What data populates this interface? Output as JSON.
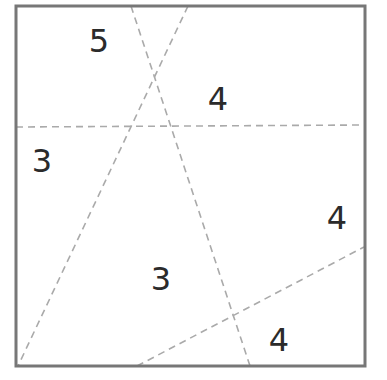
{
  "diagram": {
    "square": {
      "x1": 16,
      "y1": 6,
      "x2": 365,
      "y2": 366,
      "stroke": "#777777",
      "stroke_width": 3
    },
    "cut_lines": [
      {
        "x1": 131,
        "y1": 6,
        "x2": 250,
        "y2": 366
      },
      {
        "x1": 188,
        "y1": 6,
        "x2": 18,
        "y2": 366
      },
      {
        "x1": 16,
        "y1": 127,
        "x2": 365,
        "y2": 125
      },
      {
        "x1": 137,
        "y1": 366,
        "x2": 364,
        "y2": 247
      }
    ],
    "cut_line_color": "#aaaaaa",
    "region_labels": [
      {
        "text": "5",
        "x": 99,
        "y": 52
      },
      {
        "text": "4",
        "x": 218,
        "y": 110
      },
      {
        "text": "3",
        "x": 42,
        "y": 172
      },
      {
        "text": "4",
        "x": 337,
        "y": 229
      },
      {
        "text": "3",
        "x": 161,
        "y": 290
      },
      {
        "text": "4",
        "x": 279,
        "y": 351
      }
    ]
  }
}
